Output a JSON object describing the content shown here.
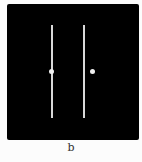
{
  "figure": {
    "panel_label": "b",
    "background_color": "#000000",
    "line_color": "#d8d8d8",
    "dot_color": "#f0f0f0",
    "lines": [
      {
        "x": 52,
        "y1": 25,
        "y2": 118
      },
      {
        "x": 84,
        "y1": 25,
        "y2": 118
      }
    ],
    "dots": [
      {
        "x": 52,
        "y": 71,
        "position": "on-left-line"
      },
      {
        "x": 92,
        "y": 71,
        "position": "right-of-right-line"
      }
    ]
  }
}
